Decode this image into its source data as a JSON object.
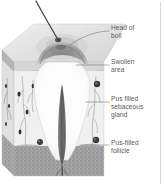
{
  "figure": {
    "background_color": "#ffffff",
    "label_color": "#5b5b5b",
    "leader_line_color": "#6e6e6e",
    "border_rule_color": "#c8c8c8"
  },
  "labels": [
    {
      "id": "head-of-boil",
      "text": "Head of\nboil",
      "lines": [
        "Head of",
        "boil"
      ]
    },
    {
      "id": "swollen-area",
      "text": "Swollen\narea",
      "lines": [
        "Swollen",
        "area"
      ]
    },
    {
      "id": "pus-filled-sebaceous-gland",
      "text": "Pus filled\nsebaceous\ngland",
      "lines": [
        "Pus filled",
        "sebaceous",
        "gland"
      ]
    },
    {
      "id": "pus-filled-follicle",
      "text": "Pus-filled\nfollicle",
      "lines": [
        "Pus-filled",
        "follicle"
      ]
    }
  ],
  "anatomy": {
    "hair": {
      "name": "hair-shaft",
      "color": "#4a4a4a"
    },
    "skin_top_surface": {
      "name": "skin-top-surface",
      "color": "#e2e2e2"
    },
    "epidermis": {
      "name": "epidermis-layer",
      "color": "#d2d2d2"
    },
    "dermis": {
      "name": "dermis-layer",
      "color": "#ededed"
    },
    "subcutaneous": {
      "name": "subcutaneous-fat-layer",
      "color": "#9a9a9a"
    },
    "pus_cavity": {
      "name": "pus-cavity",
      "color": "#fdfdfd"
    },
    "boil_head": {
      "name": "boil-head-swelling",
      "color": "#8f8f8f"
    },
    "follicle": {
      "name": "central-follicle",
      "color": "#6a6a6a"
    },
    "sebaceous_glands": {
      "name": "sebaceous-gland",
      "color": "#b9b9b9"
    }
  }
}
